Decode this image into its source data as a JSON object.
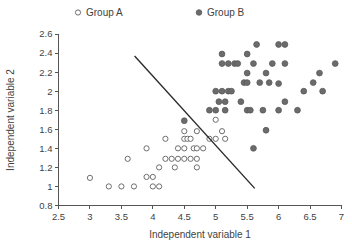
{
  "chart_data": {
    "type": "scatter",
    "title": "",
    "xlabel": "Independent variable 1",
    "ylabel": "Independent variable 2",
    "xlim": [
      2.5,
      7
    ],
    "ylim": [
      0.8,
      2.6
    ],
    "xticks": [
      "2.5",
      "3",
      "3.5",
      "4",
      "4.5",
      "5",
      "5.5",
      "6",
      "6.5",
      "7"
    ],
    "xtick_values": [
      2.5,
      3,
      3.5,
      4,
      4.5,
      5,
      5.5,
      6,
      6.5,
      7
    ],
    "yticks": [
      "0.8",
      "1",
      "1.2",
      "1.4",
      "1.6",
      "1.8",
      "2",
      "2.2",
      "2.4",
      "2.6"
    ],
    "ytick_values": [
      0.8,
      1.0,
      1.2,
      1.4,
      1.6,
      1.8,
      2.0,
      2.2,
      2.4,
      2.6
    ],
    "grid": false,
    "legend_position": "top",
    "legend": [
      {
        "name": "Group A",
        "marker": "open-circle",
        "color": "#ffffff",
        "edge_color": "#6e6e6e"
      },
      {
        "name": "Group B",
        "marker": "filled-circle",
        "color": "#6b6b6b",
        "edge_color": "#5a5a5a"
      }
    ],
    "series": [
      {
        "name": "Group A",
        "marker": "open-circle",
        "points": [
          [
            3.0,
            1.09
          ],
          [
            3.3,
            1.0
          ],
          [
            3.5,
            1.0
          ],
          [
            3.7,
            1.0
          ],
          [
            3.6,
            1.29
          ],
          [
            3.9,
            1.4
          ],
          [
            3.9,
            1.1
          ],
          [
            4.0,
            1.1
          ],
          [
            4.0,
            1.0
          ],
          [
            4.1,
            1.0
          ],
          [
            4.1,
            1.2
          ],
          [
            4.2,
            1.5
          ],
          [
            4.2,
            1.29
          ],
          [
            4.3,
            1.29
          ],
          [
            4.35,
            1.2
          ],
          [
            4.4,
            1.29
          ],
          [
            4.4,
            1.4
          ],
          [
            4.5,
            1.29
          ],
          [
            4.5,
            1.4
          ],
          [
            4.5,
            1.5
          ],
          [
            4.5,
            1.58
          ],
          [
            4.55,
            1.5
          ],
          [
            4.6,
            1.29
          ],
          [
            4.6,
            1.5
          ],
          [
            4.65,
            1.4
          ],
          [
            4.7,
            1.29
          ],
          [
            4.7,
            1.4
          ],
          [
            4.7,
            1.2
          ],
          [
            4.7,
            1.58
          ],
          [
            4.8,
            1.4
          ],
          [
            4.9,
            1.5
          ],
          [
            5.0,
            1.5
          ],
          [
            5.0,
            1.7
          ],
          [
            5.1,
            1.58
          ],
          [
            5.15,
            1.5
          ]
        ]
      },
      {
        "name": "Group B",
        "marker": "filled-circle",
        "points": [
          [
            4.5,
            1.69
          ],
          [
            4.9,
            1.8
          ],
          [
            5.0,
            1.8
          ],
          [
            5.0,
            2.0
          ],
          [
            5.05,
            1.89
          ],
          [
            5.1,
            2.0
          ],
          [
            5.1,
            2.29
          ],
          [
            5.1,
            2.39
          ],
          [
            5.15,
            1.89
          ],
          [
            5.15,
            1.8
          ],
          [
            5.2,
            2.0
          ],
          [
            5.2,
            2.29
          ],
          [
            5.25,
            2.0
          ],
          [
            5.3,
            2.29
          ],
          [
            5.35,
            2.29
          ],
          [
            5.4,
            1.89
          ],
          [
            5.45,
            2.09
          ],
          [
            5.5,
            1.8
          ],
          [
            5.5,
            2.09
          ],
          [
            5.5,
            2.19
          ],
          [
            5.5,
            2.39
          ],
          [
            5.55,
            1.8
          ],
          [
            5.6,
            1.4
          ],
          [
            5.6,
            2.29
          ],
          [
            5.65,
            2.49
          ],
          [
            5.7,
            2.09
          ],
          [
            5.75,
            1.8
          ],
          [
            5.8,
            1.59
          ],
          [
            5.8,
            2.19
          ],
          [
            5.85,
            2.09
          ],
          [
            5.9,
            2.29
          ],
          [
            6.0,
            1.8
          ],
          [
            6.0,
            2.08
          ],
          [
            6.0,
            2.49
          ],
          [
            6.1,
            1.89
          ],
          [
            6.1,
            2.29
          ],
          [
            6.1,
            2.49
          ],
          [
            6.3,
            1.8
          ],
          [
            6.4,
            2.0
          ],
          [
            6.55,
            2.09
          ],
          [
            6.65,
            2.19
          ],
          [
            6.7,
            2.0
          ],
          [
            6.9,
            2.29
          ]
        ]
      }
    ],
    "annotations": [
      {
        "type": "line",
        "name": "decision-boundary",
        "from": [
          3.71,
          2.37
        ],
        "to": [
          5.62,
          0.98
        ]
      }
    ]
  }
}
